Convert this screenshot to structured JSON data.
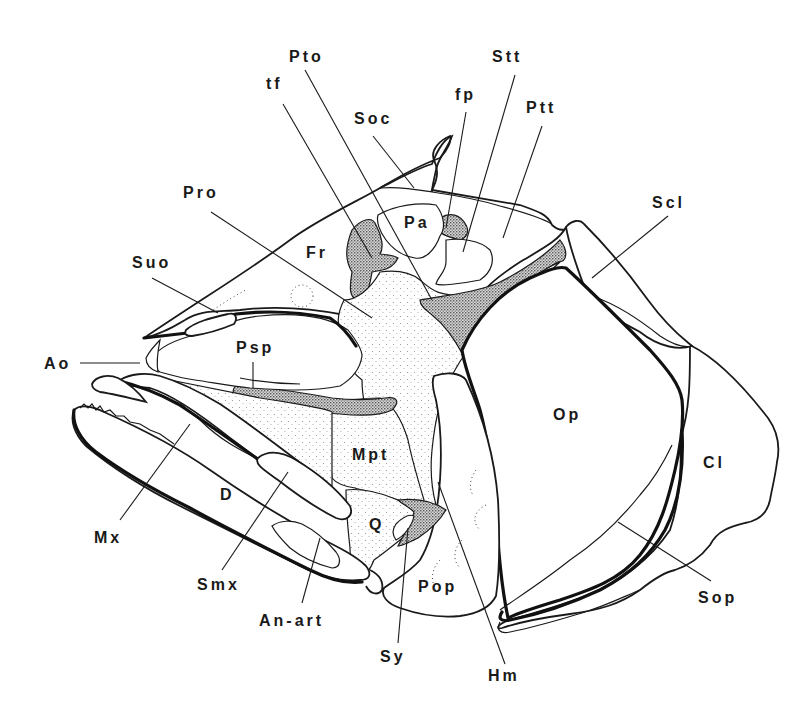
{
  "figure": {
    "colors": {
      "ink": "#1a1a1a",
      "background": "#ffffff",
      "stipple_light": "#9a9a9a",
      "stipple_dark": "#3a3a3a"
    },
    "labels": {
      "pto": "Pto",
      "stt": "Stt",
      "tf": "tf",
      "fp": "fp",
      "soc": "Soc",
      "ptt": "Ptt",
      "pro": "Pro",
      "scl": "Scl",
      "fr": "Fr",
      "pa": "Pa",
      "suo": "Suo",
      "ao": "Ao",
      "psp": "Psp",
      "op": "Op",
      "mpt": "Mpt",
      "cl": "Cl",
      "d": "D",
      "q": "Q",
      "mx": "Mx",
      "smx": "Smx",
      "pop": "Pop",
      "sop": "Sop",
      "an_art": "An-art",
      "sy": "Sy",
      "hm": "Hm"
    }
  }
}
